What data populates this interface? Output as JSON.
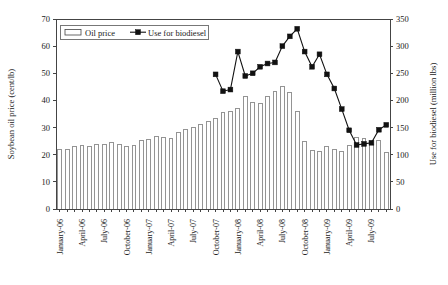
{
  "chart_data": {
    "type": "bar",
    "title": "",
    "subtitle": "",
    "xlabel": "",
    "ylabel": "Soybean oil price (cent/lb)",
    "y2label": "Use for biodiesel (million lbs)",
    "grid": false,
    "legend_position": "top-left-inside",
    "ylim": [
      0,
      70
    ],
    "y2lim": [
      0,
      350
    ],
    "yticks": [
      "0",
      "10",
      "20",
      "30",
      "40",
      "50",
      "60",
      "70"
    ],
    "ytick_values": [
      0,
      10,
      20,
      30,
      40,
      50,
      60,
      70
    ],
    "y2ticks": [
      "0",
      "50",
      "100",
      "150",
      "200",
      "250",
      "300",
      "350"
    ],
    "y2tick_values": [
      0,
      50,
      100,
      150,
      200,
      250,
      300,
      350
    ],
    "x": [
      "January-06",
      "February-06",
      "March-06",
      "April-06",
      "May-06",
      "June-06",
      "July-06",
      "August-06",
      "September-06",
      "October-06",
      "November-06",
      "December-06",
      "January-07",
      "February-07",
      "March-07",
      "April-07",
      "May-07",
      "June-07",
      "July-07",
      "August-07",
      "September-07",
      "October-07",
      "November-07",
      "December-07",
      "January-08",
      "February-08",
      "March-08",
      "April-08",
      "May-08",
      "June-08",
      "July-08",
      "August-08",
      "September-08",
      "October-08",
      "November-08",
      "December-08",
      "January-09",
      "February-09",
      "March-09",
      "April-09",
      "May-09",
      "June-09",
      "July-09",
      "August-09",
      "September-09"
    ],
    "xtick_labels": [
      {
        "index": 0,
        "label": "January-06"
      },
      {
        "index": 3,
        "label": "April-06"
      },
      {
        "index": 6,
        "label": "July-06"
      },
      {
        "index": 9,
        "label": "October-06"
      },
      {
        "index": 12,
        "label": "January-07"
      },
      {
        "index": 15,
        "label": "April-07"
      },
      {
        "index": 18,
        "label": "July-07"
      },
      {
        "index": 21,
        "label": "October-07"
      },
      {
        "index": 24,
        "label": "January-08"
      },
      {
        "index": 27,
        "label": "April-08"
      },
      {
        "index": 30,
        "label": "July-08"
      },
      {
        "index": 33,
        "label": "October-08"
      },
      {
        "index": 36,
        "label": "January-09"
      },
      {
        "index": 39,
        "label": "April-09"
      },
      {
        "index": 42,
        "label": "July-09"
      }
    ],
    "series": [
      {
        "name": "Oil price",
        "type": "bar",
        "axis": "left",
        "unit": "cent/lb",
        "values": [
          21.8,
          22.0,
          23.2,
          23.4,
          23.0,
          23.6,
          23.9,
          24.6,
          23.8,
          22.9,
          23.5,
          25.3,
          25.6,
          26.8,
          26.4,
          26.0,
          28.1,
          29.2,
          30.2,
          31.0,
          32.3,
          33.4,
          35.6,
          36.0,
          37.2,
          41.6,
          39.3,
          38.8,
          41.5,
          43.4,
          45.0,
          43.0,
          36.0,
          25.0,
          21.5,
          21.3,
          23.0,
          22.0,
          21.3,
          23.5,
          26.5,
          25.8,
          23.8,
          25.3,
          21.0
        ]
      },
      {
        "name": "Use for biodiesel",
        "type": "line",
        "axis": "right",
        "unit": "million lbs",
        "marker": "square",
        "start_index": 21,
        "values": [
          null,
          null,
          null,
          null,
          null,
          null,
          null,
          null,
          null,
          null,
          null,
          null,
          null,
          null,
          null,
          null,
          null,
          null,
          null,
          null,
          null,
          248,
          217,
          220,
          290,
          245,
          250,
          262,
          268,
          270,
          300,
          318,
          332,
          290,
          262,
          285,
          248,
          222,
          184,
          145,
          118,
          120,
          122,
          146,
          155
        ]
      }
    ],
    "legend": [
      {
        "label": "Oil price",
        "marker": "bar-swatch"
      },
      {
        "label": "Use for biodiesel",
        "marker": "line-square"
      }
    ]
  }
}
